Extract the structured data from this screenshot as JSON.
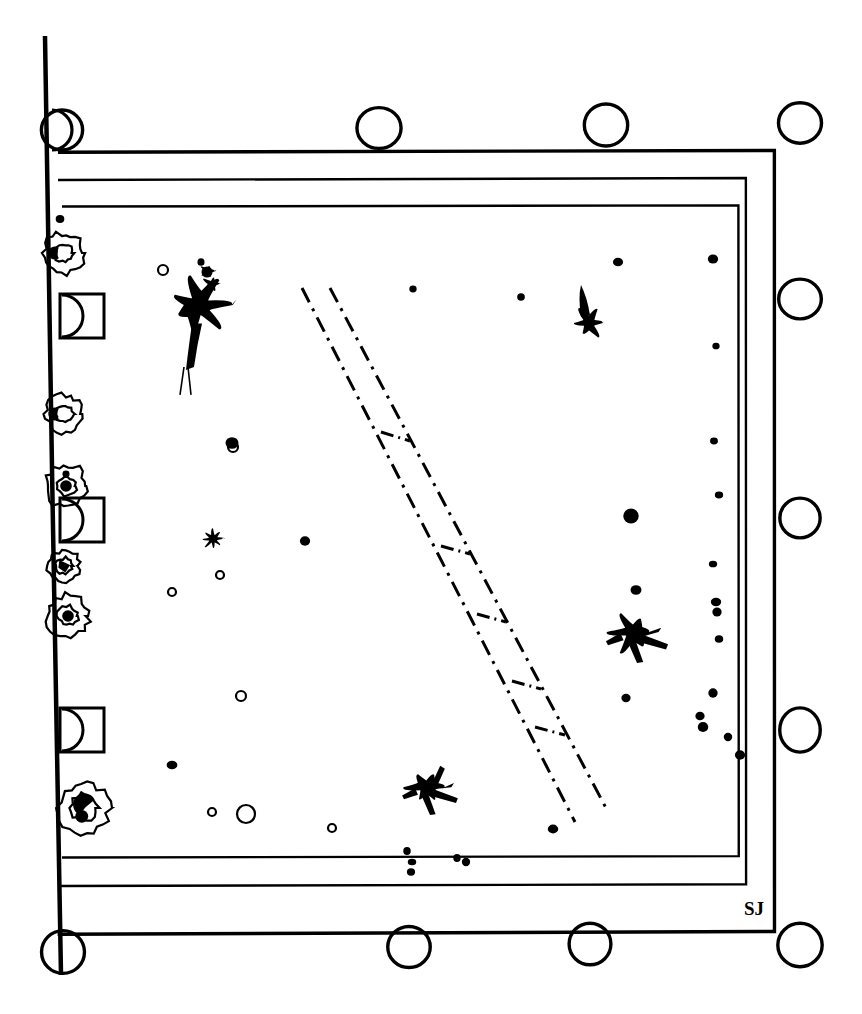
{
  "figure": {
    "medium": "ink on white paper",
    "canvas": {
      "width": 862,
      "height": 1014
    },
    "ink_color": "#000000",
    "paper_color": "#ffffff",
    "signature": {
      "text": "SJ",
      "x": 744,
      "y": 915,
      "description": "handwritten initials at inner lower-right corner"
    }
  },
  "frames": {
    "description": "Three nested hand-ruled rectangles plus a long vertical spine on the left",
    "spine": {
      "name": "left-vertical-spine",
      "x1": 45,
      "y1": 36,
      "x2": 61,
      "y2": 975,
      "stroke_width": 4.5
    },
    "rects": [
      {
        "name": "outer-frame",
        "x": 58,
        "y": 150,
        "width": 716,
        "height": 782,
        "stroke_width": 3.4,
        "skew": -2
      },
      {
        "name": "middle-frame",
        "x": 58,
        "y": 178,
        "width": 688,
        "height": 706,
        "stroke_width": 2.4,
        "skew": -2
      },
      {
        "name": "inner-frame",
        "x": 62,
        "y": 205,
        "width": 677,
        "height": 651,
        "stroke_width": 2.4,
        "skew": -2
      }
    ]
  },
  "edge_circles": {
    "description": "Open circles tangent to the outer frame along top, bottom and right edges",
    "radius": 21,
    "stroke_width": 3.4,
    "top": [
      {
        "name": "top-circle-1",
        "cx": 62,
        "cy": 130
      },
      {
        "name": "top-circle-2",
        "cx": 379,
        "cy": 128
      },
      {
        "name": "top-circle-3",
        "cx": 606,
        "cy": 125
      },
      {
        "name": "top-circle-4",
        "cx": 800,
        "cy": 123
      }
    ],
    "right": [
      {
        "name": "right-circle-1",
        "cx": 800,
        "cy": 299
      },
      {
        "name": "right-circle-2",
        "cx": 800,
        "cy": 518
      },
      {
        "name": "right-circle-3",
        "cx": 800,
        "cy": 730
      },
      {
        "name": "right-circle-4",
        "cx": 800,
        "cy": 945
      }
    ],
    "bottom": [
      {
        "name": "bottom-circle-1",
        "cx": 63,
        "cy": 952
      },
      {
        "name": "bottom-circle-2",
        "cx": 409,
        "cy": 947
      },
      {
        "name": "bottom-circle-3",
        "cx": 590,
        "cy": 944
      },
      {
        "name": "bottom-circle-4",
        "cx": 800,
        "cy": 945
      }
    ]
  },
  "left_margin_marks": {
    "description": "Marginal glyphs straddling the left spine: half-discs, boxed half-discs, and irregular blob-rings",
    "items": [
      {
        "name": "margin-halfdisc-top",
        "type": "half-disc",
        "cx": 52,
        "cy": 130,
        "r": 20
      },
      {
        "name": "margin-blobring-1",
        "type": "blob-ring",
        "cx": 64,
        "cy": 253,
        "r": 20,
        "core_r": 9,
        "pupil": "crescent"
      },
      {
        "name": "margin-boxed-halfdisc-1",
        "type": "boxed-half-disc",
        "cx": 62,
        "cy": 316,
        "r": 21,
        "box": 44
      },
      {
        "name": "margin-blobring-2",
        "type": "blob-ring",
        "cx": 64,
        "cy": 414,
        "r": 19,
        "core_r": 9,
        "pupil": "crescent"
      },
      {
        "name": "margin-blobring-3",
        "type": "blob-ring",
        "cx": 66,
        "cy": 486,
        "r": 21,
        "core_r": 10,
        "pupil": "dot"
      },
      {
        "name": "margin-boxed-halfdisc-2",
        "type": "boxed-half-disc",
        "cx": 62,
        "cy": 520,
        "r": 21,
        "box": 44
      },
      {
        "name": "margin-blobring-4",
        "type": "blob-ring",
        "cx": 64,
        "cy": 566,
        "r": 16,
        "core_r": 8,
        "pupil": "wedge"
      },
      {
        "name": "margin-blobring-5",
        "type": "blob-ring",
        "cx": 68,
        "cy": 616,
        "r": 21,
        "core_r": 10,
        "pupil": "dot"
      },
      {
        "name": "margin-boxed-halfdisc-3",
        "type": "boxed-half-disc",
        "cx": 62,
        "cy": 730,
        "r": 21,
        "box": 44
      },
      {
        "name": "margin-blobring-6",
        "type": "blob-ring",
        "cx": 84,
        "cy": 808,
        "r": 25,
        "core_r": 13,
        "pupil": "comma"
      }
    ]
  },
  "diagonal_band": {
    "description": "Long narrow dash-dot band running from upper-left to lower-right with periodic cross-tie rungs",
    "line_style": "dash-dot",
    "stroke_width": 3.0,
    "dash_pattern": "16 7 3 7",
    "left_rail": {
      "x1": 302,
      "y1": 288,
      "x2": 575,
      "y2": 822
    },
    "right_rail": {
      "x1": 330,
      "y1": 288,
      "x2": 606,
      "y2": 808
    },
    "rungs": [
      {
        "name": "band-rung-1",
        "x1": 381,
        "y1": 432,
        "x2": 410,
        "y2": 441
      },
      {
        "name": "band-rung-2",
        "x1": 441,
        "y1": 546,
        "x2": 470,
        "y2": 554
      },
      {
        "name": "band-rung-3",
        "x1": 477,
        "y1": 614,
        "x2": 506,
        "y2": 622
      },
      {
        "name": "band-rung-4",
        "x1": 512,
        "y1": 681,
        "x2": 541,
        "y2": 689
      },
      {
        "name": "band-rung-5",
        "x1": 535,
        "y1": 727,
        "x2": 565,
        "y2": 735
      }
    ]
  },
  "ink_blots": {
    "description": "Large splattered ink marks distributed across the plate interior",
    "items": [
      {
        "name": "blot-starburst-upper-left",
        "cx": 198,
        "cy": 305,
        "size": 62,
        "style": "starburst with trailing tail"
      },
      {
        "name": "blot-teardrop-upper-right",
        "cx": 589,
        "cy": 317,
        "size": 34,
        "style": "round head with upward spike"
      },
      {
        "name": "blot-oval-mid-left",
        "cx": 213,
        "cy": 539,
        "size": 21,
        "style": "solid oval"
      },
      {
        "name": "blot-bird-right",
        "cx": 637,
        "cy": 635,
        "size": 58,
        "style": "angular wing with long tail"
      },
      {
        "name": "blot-bird-lower-center",
        "cx": 430,
        "cy": 790,
        "size": 52,
        "style": "angular splash with legs"
      }
    ]
  },
  "speckles": {
    "description": "Scattered small filled dots and open rings across the field",
    "filled": [
      {
        "cx": 201,
        "cy": 262,
        "r": 4
      },
      {
        "cx": 207,
        "cy": 272,
        "r": 6
      },
      {
        "cx": 413,
        "cy": 289,
        "r": 4
      },
      {
        "cx": 521,
        "cy": 297,
        "r": 4
      },
      {
        "cx": 618,
        "cy": 262,
        "r": 5
      },
      {
        "cx": 713,
        "cy": 259,
        "r": 5
      },
      {
        "cx": 716,
        "cy": 346,
        "r": 4
      },
      {
        "cx": 60,
        "cy": 219,
        "r": 4
      },
      {
        "cx": 232,
        "cy": 443,
        "r": 6
      },
      {
        "cx": 305,
        "cy": 541,
        "r": 5
      },
      {
        "cx": 714,
        "cy": 441,
        "r": 4
      },
      {
        "cx": 631,
        "cy": 516,
        "r": 8
      },
      {
        "cx": 719,
        "cy": 495,
        "r": 4
      },
      {
        "cx": 636,
        "cy": 590,
        "r": 5
      },
      {
        "cx": 713,
        "cy": 564,
        "r": 4
      },
      {
        "cx": 716,
        "cy": 602,
        "r": 5
      },
      {
        "cx": 717,
        "cy": 612,
        "r": 5
      },
      {
        "cx": 719,
        "cy": 639,
        "r": 4
      },
      {
        "cx": 626,
        "cy": 698,
        "r": 5
      },
      {
        "cx": 713,
        "cy": 693,
        "r": 5
      },
      {
        "cx": 700,
        "cy": 716,
        "r": 5
      },
      {
        "cx": 703,
        "cy": 727,
        "r": 5
      },
      {
        "cx": 728,
        "cy": 737,
        "r": 4
      },
      {
        "cx": 740,
        "cy": 755,
        "r": 5
      },
      {
        "cx": 172,
        "cy": 765,
        "r": 5
      },
      {
        "cx": 553,
        "cy": 829,
        "r": 5
      },
      {
        "cx": 407,
        "cy": 851,
        "r": 4
      },
      {
        "cx": 412,
        "cy": 862,
        "r": 4
      },
      {
        "cx": 411,
        "cy": 872,
        "r": 4
      },
      {
        "cx": 457,
        "cy": 858,
        "r": 4
      },
      {
        "cx": 466,
        "cy": 862,
        "r": 4
      },
      {
        "cx": 66,
        "cy": 474,
        "r": 4
      }
    ],
    "rings": [
      {
        "cx": 163,
        "cy": 270,
        "r": 5
      },
      {
        "cx": 233,
        "cy": 447,
        "r": 5
      },
      {
        "cx": 220,
        "cy": 575,
        "r": 4
      },
      {
        "cx": 172,
        "cy": 592,
        "r": 4
      },
      {
        "cx": 241,
        "cy": 696,
        "r": 5
      },
      {
        "cx": 212,
        "cy": 812,
        "r": 4
      },
      {
        "cx": 246,
        "cy": 814,
        "r": 9
      },
      {
        "cx": 332,
        "cy": 828,
        "r": 4
      }
    ]
  }
}
